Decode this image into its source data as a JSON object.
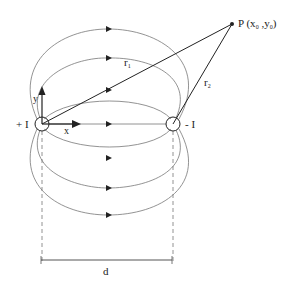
{
  "diagram": {
    "colors": {
      "line": "#777777",
      "ink": "#222222",
      "background": "#ffffff"
    },
    "sources": [
      {
        "id": "left",
        "label": "+ I",
        "cx": 42,
        "cy": 124,
        "r": 7
      },
      {
        "id": "right",
        "label": "- I",
        "cx": 173,
        "cy": 124,
        "r": 7
      }
    ],
    "axes": {
      "x_label": "x",
      "y_label": "y"
    },
    "point": {
      "label_main": "P (x",
      "sub0": "0",
      "comma_y": " ,y",
      "sub1": "0",
      "close": ")",
      "x": 232,
      "y": 24
    },
    "vectors": {
      "r1": "r",
      "r1_sub": "1",
      "r2": "r",
      "r2_sub": "2"
    },
    "dimension": {
      "label": "d"
    }
  }
}
